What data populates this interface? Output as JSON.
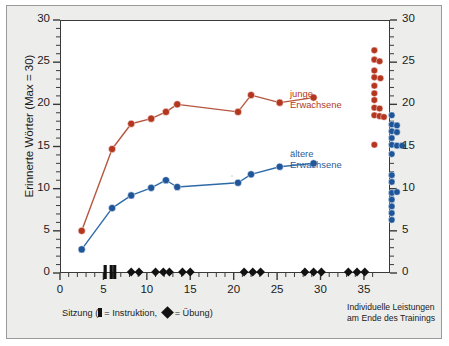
{
  "chart_data": {
    "type": "line",
    "title": "",
    "xlabel": "Sitzung (▮= Instruktion, ◆ = Übung)",
    "ylabel": "Erinnerte Wörter (Max = 30)",
    "ylabel_right": "Erinnerte Wörter (Max = 30)",
    "xlim": [
      0,
      38
    ],
    "ylim": [
      0,
      30
    ],
    "xticks": [
      0,
      5,
      10,
      15,
      20,
      25,
      30,
      35
    ],
    "yticks": [
      0,
      5,
      10,
      15,
      20,
      25,
      30
    ],
    "xticklabels": [
      "0",
      "5",
      "10",
      "15",
      "20",
      "25",
      "30",
      "35"
    ],
    "yticklabels": [
      "0",
      "5",
      "10",
      "15",
      "20",
      "25",
      "30"
    ],
    "y_minor_step": 1,
    "x_minor_step": 1,
    "grid": false,
    "legend_position": "inline-right",
    "series": [
      {
        "name": "junge Erwachsene",
        "color": "#b5361f",
        "line_color": "#b5573f",
        "x": [
          2.5,
          6.0,
          8.2,
          10.5,
          12.2,
          13.5,
          20.5,
          22.0,
          25.3,
          29.2
        ],
        "values": [
          5.0,
          14.7,
          17.7,
          18.3,
          19.1,
          20.0,
          19.1,
          21.1,
          20.2,
          20.8
        ]
      },
      {
        "name": "ältere Erwachsene",
        "color": "#1f5699",
        "line_color": "#2d6aa8",
        "x": [
          2.5,
          6.0,
          8.2,
          10.5,
          12.2,
          13.5,
          20.5,
          22.0,
          25.3,
          29.2
        ],
        "values": [
          2.8,
          7.7,
          9.2,
          10.1,
          11.0,
          10.2,
          10.7,
          11.7,
          12.6,
          13.0
        ]
      }
    ],
    "strip_plots": [
      {
        "name": "junge Erwachsene individuelle Leistungen",
        "color": "#b5361f",
        "x_center": 36.2,
        "points": [
          {
            "x": 36.2,
            "y": 26.4
          },
          {
            "x": 36.2,
            "y": 25.3
          },
          {
            "x": 36.8,
            "y": 25.1
          },
          {
            "x": 36.2,
            "y": 24.0
          },
          {
            "x": 36.2,
            "y": 23.2
          },
          {
            "x": 36.9,
            "y": 23.1
          },
          {
            "x": 36.2,
            "y": 22.2
          },
          {
            "x": 36.2,
            "y": 21.3
          },
          {
            "x": 36.2,
            "y": 20.5
          },
          {
            "x": 36.2,
            "y": 19.6
          },
          {
            "x": 36.8,
            "y": 19.5
          },
          {
            "x": 36.2,
            "y": 18.7
          },
          {
            "x": 36.8,
            "y": 18.6
          },
          {
            "x": 37.3,
            "y": 18.5
          },
          {
            "x": 36.2,
            "y": 15.2
          }
        ]
      },
      {
        "name": "ältere Erwachsene individuelle Leistungen",
        "color": "#1f5699",
        "x_center": 38.2,
        "points": [
          {
            "x": 38.2,
            "y": 18.7
          },
          {
            "x": 38.2,
            "y": 17.6
          },
          {
            "x": 38.8,
            "y": 17.5
          },
          {
            "x": 38.2,
            "y": 16.8
          },
          {
            "x": 38.8,
            "y": 16.7
          },
          {
            "x": 38.2,
            "y": 16.0
          },
          {
            "x": 38.2,
            "y": 15.2
          },
          {
            "x": 38.8,
            "y": 15.1
          },
          {
            "x": 39.4,
            "y": 15.1
          },
          {
            "x": 38.2,
            "y": 14.1
          },
          {
            "x": 38.2,
            "y": 11.6
          },
          {
            "x": 38.2,
            "y": 10.8
          },
          {
            "x": 38.2,
            "y": 9.5
          },
          {
            "x": 38.8,
            "y": 9.6
          },
          {
            "x": 38.2,
            "y": 8.7
          },
          {
            "x": 38.2,
            "y": 7.9
          },
          {
            "x": 38.2,
            "y": 7.1
          },
          {
            "x": 38.2,
            "y": 6.3
          }
        ]
      }
    ],
    "session_markers": {
      "instruction_label": "Instruktion",
      "practice_label": "Übung",
      "instruction_x": [
        5.2,
        5.9,
        6.3
      ],
      "practice_x": [
        8.2,
        9.1,
        11.0,
        11.9,
        12.6,
        14.1,
        15.0,
        21.2,
        22.2,
        23.1,
        28.2,
        29.2,
        30.1,
        33.2,
        34.2,
        35.1
      ]
    },
    "annotations": [
      {
        "text": "junge Erwachsene",
        "color": "#b5361f"
      },
      {
        "text": "ältere Erwachsene",
        "color": "#1f5699"
      },
      {
        "text": "Individuelle Leistungen am Ende des Trainings",
        "color": "#1b1b1b"
      }
    ]
  },
  "labels": {
    "y_axis_title": "Erinnerte Wörter (Max = 30)",
    "x_axis_caption_prefix": "Sitzung (",
    "x_axis_caption_instruction": "= Instruktion,",
    "x_axis_caption_practice": "= Übung)",
    "series_young_line1": "junge",
    "series_young_line2": "Erwachsene",
    "series_old_line1": "ältere",
    "series_old_line2": "Erwachsene",
    "corner_note_line1": "Individuelle Leistungen",
    "corner_note_line2": "am Ende des Trainings"
  },
  "colors": {
    "young": "#b5361f",
    "young_line": "#b5573f",
    "old": "#1f5699",
    "old_line": "#2d6aa8",
    "axis": "#3a3a3a",
    "card_bg": "#ededec",
    "plot_bg": "#ffffff",
    "text": "#1b1b1b"
  }
}
